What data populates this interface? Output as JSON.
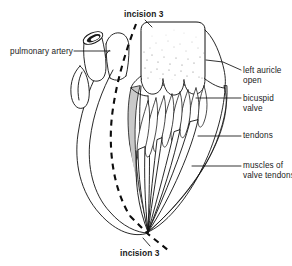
{
  "figure": {
    "background": "#ffffff",
    "ink": "#111111",
    "shade": "#c9c9c9",
    "stipple": "#8a8a8a"
  },
  "labels": {
    "pulmonary_artery": "pulmonary artery",
    "incision_top": "incision 3",
    "incision_bottom": "incision 3",
    "left_auricle_line1": "left auricle",
    "left_auricle_line2": "open",
    "bicuspid_line1": "bicuspid",
    "bicuspid_line2": "valve",
    "tendons": "tendons",
    "muscles_line1": "muscles of",
    "muscles_line2": "valve tendons"
  },
  "parts": [
    {
      "name": "pulmonary-artery",
      "label": "pulmonary artery"
    },
    {
      "name": "left-auricle-open",
      "label": "left auricle open"
    },
    {
      "name": "bicuspid-valve",
      "label": "bicuspid valve"
    },
    {
      "name": "tendons",
      "label": "tendons"
    },
    {
      "name": "muscles-of-valve-tendons",
      "label": "muscles of valve tendons"
    },
    {
      "name": "incision-line",
      "label": "incision 3"
    }
  ]
}
